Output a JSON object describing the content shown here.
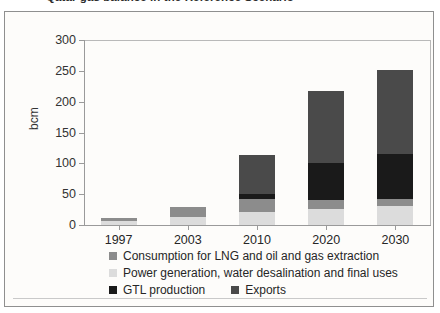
{
  "figure": {
    "title_partial": "Qatar gas balance in the Reference Scenario",
    "y_axis_title": "bcm"
  },
  "chart_data": {
    "type": "bar",
    "stacked": true,
    "title": "Qatar gas balance in the Reference Scenario",
    "xlabel": "",
    "ylabel": "bcm",
    "ylim": [
      0,
      300
    ],
    "yticks": [
      0,
      50,
      100,
      150,
      200,
      250,
      300
    ],
    "ytick_labels": [
      "0",
      "50",
      "100",
      "150",
      "200",
      "250",
      "300"
    ],
    "grid": false,
    "legend_position": "bottom",
    "categories": [
      "1997",
      "2003",
      "2010",
      "2020",
      "2030"
    ],
    "series": [
      {
        "name": "Power generation, water desalination and final uses",
        "color": "#dcdcdc",
        "values": [
          7,
          13,
          21,
          26,
          31
        ]
      },
      {
        "name": "Consumption for LNG and oil and gas extraction",
        "color": "#8c8c8c",
        "values": [
          5,
          17,
          22,
          14,
          11
        ]
      },
      {
        "name": "GTL production",
        "color": "#1a1a1a",
        "values": [
          0,
          0,
          8,
          60,
          73
        ]
      },
      {
        "name": "Exports",
        "color": "#4a4a4a",
        "values": [
          0,
          0,
          62,
          117,
          136
        ]
      }
    ],
    "totals": [
      12,
      30,
      113,
      217,
      251
    ]
  },
  "legend": {
    "rows": [
      [
        {
          "label": "Consumption for LNG and oil and gas extraction",
          "color": "#8c8c8c"
        }
      ],
      [
        {
          "label": "Power generation, water desalination and final uses",
          "color": "#dcdcdc"
        }
      ],
      [
        {
          "label": "GTL production",
          "color": "#1a1a1a"
        },
        {
          "label": "Exports",
          "color": "#4a4a4a"
        }
      ]
    ]
  }
}
